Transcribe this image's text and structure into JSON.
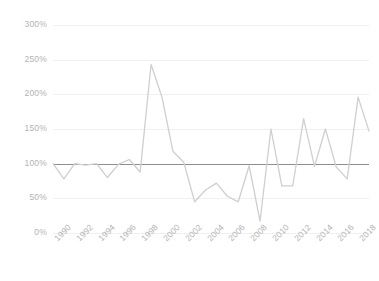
{
  "chart_data": {
    "type": "line",
    "title": "",
    "subtitle": "",
    "xlabel": "",
    "ylabel": "",
    "grid": true,
    "legend": "none",
    "ylim": [
      0,
      300
    ],
    "yticks": [
      0,
      50,
      100,
      150,
      200,
      250,
      300
    ],
    "ytick_labels": [
      "0%",
      "50%",
      "100%",
      "150%",
      "200%",
      "250%",
      "300%"
    ],
    "xtick_labels": [
      "1990",
      "1992",
      "1994",
      "1996",
      "1998",
      "2000",
      "2002",
      "2004",
      "2006",
      "2008",
      "2010",
      "2012",
      "2014",
      "2016",
      "2018"
    ],
    "reference_line": 100,
    "x": [
      1990,
      1991,
      1992,
      1993,
      1994,
      1995,
      1996,
      1997,
      1998,
      1999,
      2000,
      2001,
      2002,
      2003,
      2004,
      2005,
      2006,
      2007,
      2008,
      2009,
      2010,
      2011,
      2012,
      2013,
      2014,
      2015,
      2016,
      2017,
      2018,
      2019
    ],
    "series": [
      {
        "name": "Value",
        "color": "#cfcfcf",
        "values": [
          100,
          78,
          100,
          98,
          100,
          80,
          99,
          106,
          88,
          243,
          196,
          118,
          102,
          45,
          62,
          72,
          53,
          45,
          97,
          17,
          150,
          68,
          68,
          165,
          96,
          150,
          95,
          78,
          196,
          147
        ]
      }
    ]
  },
  "axis": {
    "y_color": "#b3b3b3",
    "x_color": "#b3b3b3",
    "grid_color": "#f0f0f0",
    "baseline_color": "#8e8e8e"
  }
}
